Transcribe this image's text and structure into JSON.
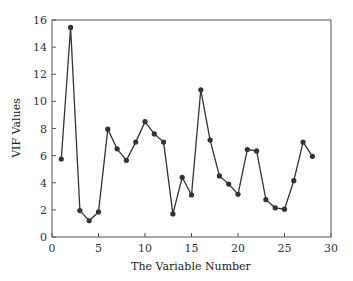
{
  "chart_data": {
    "type": "line",
    "title": "",
    "xlabel": "The Variable Number",
    "ylabel": "VIF Values",
    "xlim": [
      0,
      30
    ],
    "ylim": [
      0,
      16
    ],
    "xticks": [
      0,
      5,
      10,
      15,
      20,
      25,
      30
    ],
    "yticks": [
      0,
      2,
      4,
      6,
      8,
      10,
      12,
      14,
      16
    ],
    "grid": false,
    "legend": null,
    "series": [
      {
        "name": "VIF",
        "marker": "circle",
        "color": "#333333",
        "x": [
          1,
          2,
          3,
          4,
          5,
          6,
          7,
          8,
          9,
          10,
          11,
          12,
          13,
          14,
          15,
          16,
          17,
          18,
          19,
          20,
          21,
          22,
          23,
          24,
          25,
          26,
          27,
          28
        ],
        "values": [
          5.75,
          15.45,
          1.95,
          1.2,
          1.85,
          7.95,
          6.5,
          5.65,
          7.0,
          8.5,
          7.6,
          7.0,
          1.7,
          4.4,
          3.1,
          10.85,
          7.15,
          4.5,
          3.9,
          3.15,
          6.45,
          6.35,
          2.75,
          2.15,
          2.05,
          4.15,
          7.0,
          5.95
        ]
      }
    ]
  }
}
